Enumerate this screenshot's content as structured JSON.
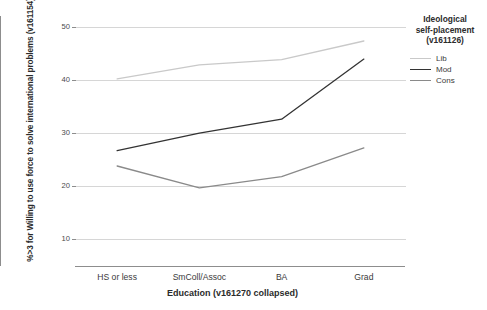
{
  "chart_data": {
    "type": "line",
    "title": "",
    "xlabel": "Education (v161270 collapsed)",
    "ylabel": "%>3 for Willing to use force to solve international problems (v161154)",
    "categories": [
      "HS or less",
      "SmColl/Assoc",
      "BA",
      "Grad"
    ],
    "ylim": [
      5,
      52
    ],
    "yticks": [
      10,
      20,
      30,
      40,
      50
    ],
    "ytick_labels": [
      "10",
      "20",
      "30",
      "40",
      "50"
    ],
    "grid": true,
    "legend_position": "right",
    "legend_title": "Ideological self-placement (v161126)",
    "series": [
      {
        "name": "Lib",
        "values": [
          40.2,
          42.8,
          43.8,
          47.3
        ],
        "color": "#c9c9c9"
      },
      {
        "name": "Mod",
        "values": [
          26.7,
          30.0,
          32.6,
          43.9
        ],
        "color": "#333333"
      },
      {
        "name": "Cons",
        "values": [
          23.8,
          19.7,
          21.8,
          27.2
        ],
        "color": "#8a8a8a"
      }
    ]
  },
  "axes": {
    "y_title": "%>3 for Willing to use force to solve international problems (v161154)",
    "x_title": "Education (v161270 collapsed)",
    "y_tick_labels": [
      "50",
      "40",
      "30",
      "20",
      "10"
    ],
    "x_tick_labels": [
      "HS or less",
      "SmColl/Assoc",
      "BA",
      "Grad"
    ]
  },
  "legend": {
    "title_line_1": "Ideological",
    "title_line_2": "self-placement",
    "title_line_3": "(v161126)",
    "items": [
      {
        "label": "Lib",
        "color": "#c9c9c9"
      },
      {
        "label": "Mod",
        "color": "#333333"
      },
      {
        "label": "Cons",
        "color": "#8a8a8a"
      }
    ]
  }
}
